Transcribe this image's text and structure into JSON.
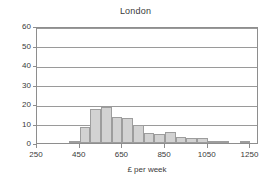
{
  "chart_data": {
    "type": "bar",
    "title": "London",
    "xlabel": "£ per week",
    "ylabel": "",
    "xlim": [
      250,
      1290
    ],
    "ylim": [
      0,
      60
    ],
    "grid": true,
    "legend": false,
    "legend_position": "none",
    "bin_width": 50,
    "xticks": [
      250,
      450,
      650,
      850,
      1050,
      1250
    ],
    "xtick_labels": [
      "250",
      "450",
      "650",
      "850",
      "1050",
      "1250"
    ],
    "yticks": [
      0,
      10,
      20,
      30,
      40,
      50,
      60
    ],
    "ytick_labels": [
      "0",
      "10",
      "20",
      "30",
      "40",
      "50",
      "60"
    ],
    "bin_starts": [
      400,
      450,
      500,
      550,
      600,
      650,
      700,
      750,
      800,
      850,
      900,
      950,
      1000,
      1050,
      1100,
      1150,
      1200
    ],
    "categories": [
      "400-450",
      "450-500",
      "500-550",
      "550-600",
      "600-650",
      "650-700",
      "700-750",
      "750-800",
      "800-850",
      "850-900",
      "900-950",
      "950-1000",
      "1000-1050",
      "1050-1100",
      "1100-1150",
      "1150-1200",
      "1200-1250"
    ],
    "values": [
      1,
      8,
      17.5,
      18.3,
      13.5,
      13,
      9,
      5,
      4.5,
      5.5,
      3,
      2.5,
      2.5,
      0.8,
      0.5,
      0,
      0.8
    ],
    "colors": {
      "bar_fill": "#d2d2d2",
      "bar_border": "#9d9d9d",
      "grid": "#9a9a9a",
      "axis": "#8e8e8e",
      "text": "#3a3a3a",
      "background": "#ffffff"
    }
  }
}
